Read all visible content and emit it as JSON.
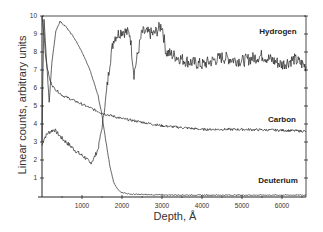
{
  "chart_data": {
    "type": "line",
    "title": "",
    "xlabel": "Depth, Å",
    "ylabel": "Linear counts, arbitrary units",
    "xlim": [
      0,
      6600
    ],
    "ylim": [
      0,
      10
    ],
    "grid": false,
    "legend_position": "inline labels at right",
    "x_ticks": [
      1000,
      2000,
      3000,
      4000,
      5000,
      6000
    ],
    "y_ticks": [
      1,
      2,
      3,
      4,
      5,
      6,
      7,
      8,
      9,
      10
    ],
    "series": [
      {
        "name": "Hydrogen",
        "label_position": {
          "x": 5900,
          "y": 9.0
        },
        "x": [
          0,
          50,
          150,
          300,
          500,
          700,
          900,
          1100,
          1200,
          1300,
          1400,
          1500,
          1600,
          1700,
          1800,
          2000,
          2200,
          2300,
          2500,
          2800,
          3000,
          3100,
          3300,
          3600,
          4000,
          4500,
          5000,
          5500,
          6000,
          6300,
          6600
        ],
        "values": [
          2.8,
          3.2,
          3.5,
          3.7,
          3.2,
          2.8,
          2.4,
          2.1,
          1.8,
          2.1,
          2.6,
          3.8,
          5.5,
          7.5,
          8.8,
          9.2,
          9.0,
          6.8,
          9.1,
          9.0,
          9.5,
          8.0,
          7.8,
          7.5,
          7.3,
          7.7,
          7.5,
          7.8,
          7.3,
          7.6,
          7.2
        ]
      },
      {
        "name": "Carbon",
        "label_position": {
          "x": 6000,
          "y": 4.1
        },
        "x": [
          0,
          50,
          100,
          200,
          300,
          500,
          800,
          1000,
          1200,
          1500,
          2000,
          2500,
          3000,
          3500,
          4000,
          5000,
          6000,
          6600
        ],
        "values": [
          10,
          9.0,
          7.5,
          6.4,
          6.0,
          5.6,
          5.3,
          5.1,
          4.9,
          4.6,
          4.3,
          4.1,
          3.9,
          3.8,
          3.7,
          3.7,
          3.65,
          3.6
        ]
      },
      {
        "name": "Deuterium",
        "label_position": {
          "x": 5900,
          "y": 0.7
        },
        "x": [
          0,
          20,
          50,
          100,
          180,
          250,
          350,
          450,
          600,
          800,
          1000,
          1200,
          1400,
          1500,
          1600,
          1700,
          1800,
          1900,
          2000,
          2200,
          2500,
          3000,
          4000,
          5000,
          6000,
          6600
        ],
        "values": [
          3.0,
          6.4,
          9.8,
          8.0,
          5.2,
          7.5,
          9.2,
          9.7,
          9.4,
          8.8,
          8.0,
          7.0,
          5.6,
          4.5,
          3.0,
          1.6,
          0.7,
          0.35,
          0.2,
          0.1,
          0.08,
          0.06,
          0.05,
          0.05,
          0.05,
          0.05
        ]
      }
    ]
  },
  "plot": {
    "x_axis_title": "Depth, Å",
    "y_axis_title": "Linear counts, arbitrary units"
  }
}
